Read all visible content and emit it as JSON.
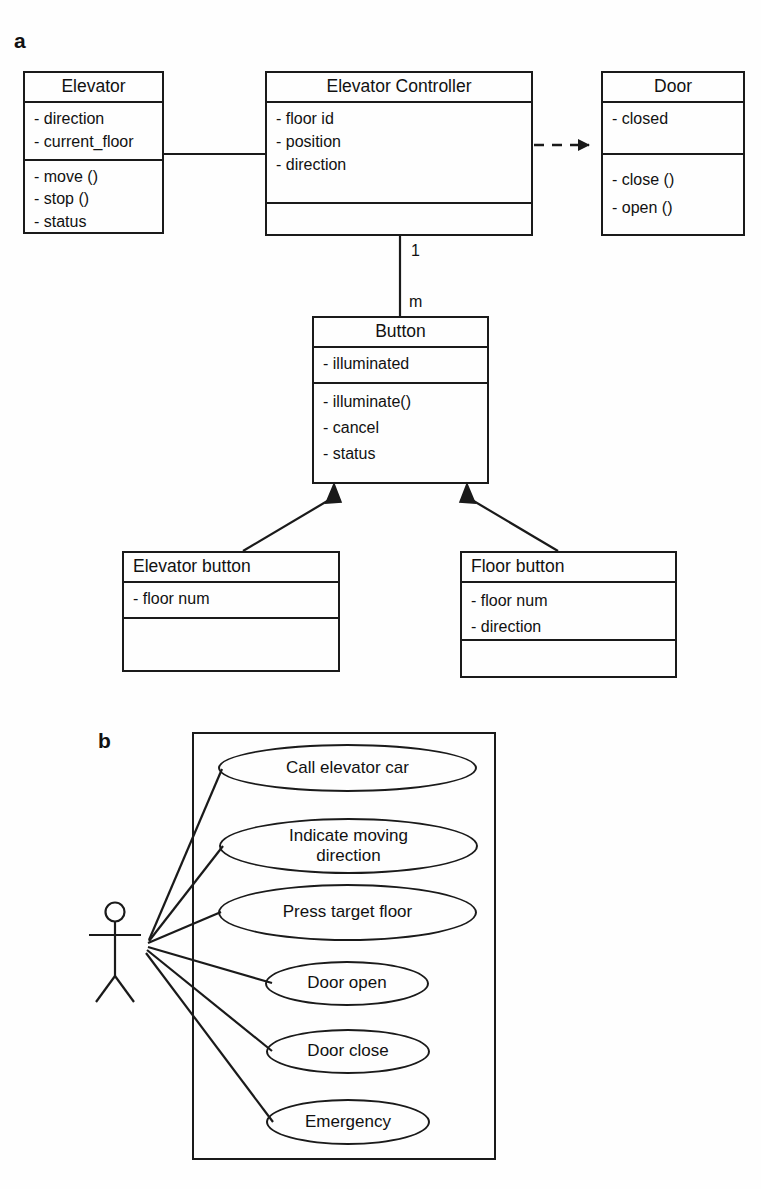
{
  "figure": {
    "panel_a_label": "a",
    "panel_b_label": "b"
  },
  "class_diagram": {
    "classes": [
      {
        "id": "elevator",
        "name": "Elevator",
        "attributes": [
          "- direction",
          "- current_floor"
        ],
        "operations": [
          "- move ()",
          "- stop ()",
          "- status"
        ]
      },
      {
        "id": "elevator-controller",
        "name": "Elevator Controller",
        "attributes": [
          "- floor id",
          "- position",
          "- direction"
        ],
        "operations": []
      },
      {
        "id": "door",
        "name": "Door",
        "attributes": [
          "- closed"
        ],
        "operations": [
          "- close ()",
          "- open ()"
        ]
      },
      {
        "id": "button",
        "name": "Button",
        "attributes": [
          "- illuminated"
        ],
        "operations": [
          "- illuminate()",
          "- cancel",
          "- status"
        ]
      },
      {
        "id": "elevator-button",
        "name": "Elevator button",
        "attributes": [
          "- floor num"
        ],
        "operations": []
      },
      {
        "id": "floor-button",
        "name": "Floor button",
        "attributes": [
          "- floor num",
          "- direction"
        ],
        "operations": []
      }
    ],
    "relationships": [
      {
        "id": "assoc-elevator-controller",
        "type": "association",
        "from": "Elevator",
        "to": "Elevator Controller",
        "style": "solid"
      },
      {
        "id": "dep-controller-door",
        "type": "dependency",
        "from": "Elevator Controller",
        "to": "Door",
        "style": "dashed-arrow"
      },
      {
        "id": "assoc-controller-button",
        "type": "association",
        "from": "Elevator Controller",
        "to": "Button",
        "style": "solid",
        "source_multiplicity": "1",
        "target_multiplicity": "m"
      },
      {
        "id": "gen-elevator-button",
        "type": "generalization",
        "from": "Elevator button",
        "to": "Button",
        "style": "solid-filled-triangle"
      },
      {
        "id": "gen-floor-button",
        "type": "generalization",
        "from": "Floor button",
        "to": "Button",
        "style": "solid-filled-triangle"
      }
    ],
    "multiplicity_labels": {
      "controller_end": "1",
      "button_end": "m"
    }
  },
  "use_case_diagram": {
    "actor_name": "user-actor",
    "use_cases": [
      {
        "id": "call-elevator-car",
        "label": "Call elevator car"
      },
      {
        "id": "indicate-moving-direction",
        "label": "Indicate moving direction"
      },
      {
        "id": "press-target-floor",
        "label": "Press target floor"
      },
      {
        "id": "door-open",
        "label": "Door open"
      },
      {
        "id": "door-close",
        "label": "Door close"
      },
      {
        "id": "emergency",
        "label": "Emergency"
      }
    ]
  },
  "colors": {
    "stroke": "#1a1a1a",
    "background": "#ffffff",
    "text": "#111111"
  }
}
